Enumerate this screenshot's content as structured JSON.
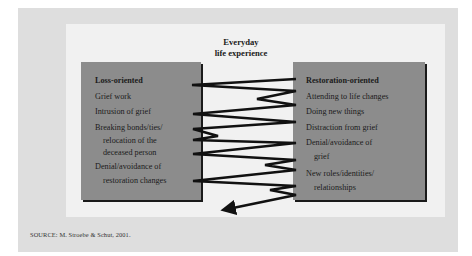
{
  "figure": {
    "title_lines": [
      "Everyday",
      "life experience"
    ],
    "left_box": {
      "heading": "Loss-oriented",
      "items": [
        {
          "lines": [
            "Grief work"
          ]
        },
        {
          "lines": [
            "Intrusion of grief"
          ]
        },
        {
          "lines": [
            "Breaking bonds/ties/",
            "relocation of the",
            "deceased person"
          ]
        },
        {
          "lines": [
            "Denial/avoidance of",
            "restoration changes"
          ]
        }
      ]
    },
    "right_box": {
      "heading": "Restoration-oriented",
      "items": [
        {
          "lines": [
            "Attending to life changes"
          ]
        },
        {
          "lines": [
            "Doing new things"
          ]
        },
        {
          "lines": [
            "Distraction from grief"
          ]
        },
        {
          "lines": [
            "Denial/avoidance of",
            "grief"
          ]
        },
        {
          "lines": [
            "New roles/identities/",
            "relationships"
          ]
        }
      ]
    },
    "oscillation_path": "oscillating zigzag line between loss-oriented and restoration-oriented boxes ending in an arrow",
    "source": "SOURCE: M. Stroebe & Schut, 2001."
  },
  "colors": {
    "outer_panel": "#dedede",
    "inner_panel": "#f1f1f1",
    "box_fill": "#8c8c8c",
    "line": "#111111"
  }
}
